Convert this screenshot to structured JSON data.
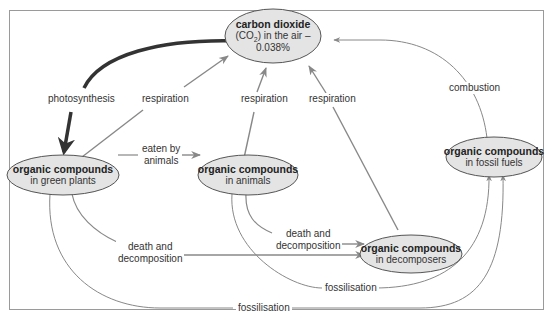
{
  "diagram": {
    "nodes": {
      "co2": {
        "title": "carbon dioxide",
        "line2_pre": "(CO",
        "line2_sub": "2",
        "line2_post": ") in the air –",
        "line3": "0.038%"
      },
      "plants": {
        "title": "organic compounds",
        "sub": "in green plants"
      },
      "animals": {
        "title": "organic compounds",
        "sub": "in animals"
      },
      "decomposers": {
        "title": "organic compounds",
        "sub": "in decomposers"
      },
      "fossil": {
        "title": "organic compounds",
        "sub": "in fossil fuels"
      }
    },
    "edges": {
      "photosynthesis": "photosynthesis",
      "resp_plants": "respiration",
      "resp_animals": "respiration",
      "resp_decomposers": "respiration",
      "combustion": "combustion",
      "eaten_line1": "eaten by",
      "eaten_line2": "animals",
      "death_animals_line1": "death and",
      "death_animals_line2": "decomposition",
      "death_plants_line1": "death and",
      "death_plants_line2": "decomposition",
      "fossil_animals": "fossilisation",
      "fossil_plants": "fossilisation"
    },
    "colors": {
      "node_fill": "#e4e4e4",
      "node_stroke": "#555555",
      "arrow": "#888888",
      "photosynthesis_arrow": "#333333",
      "frame": "#9a9a9a"
    }
  }
}
